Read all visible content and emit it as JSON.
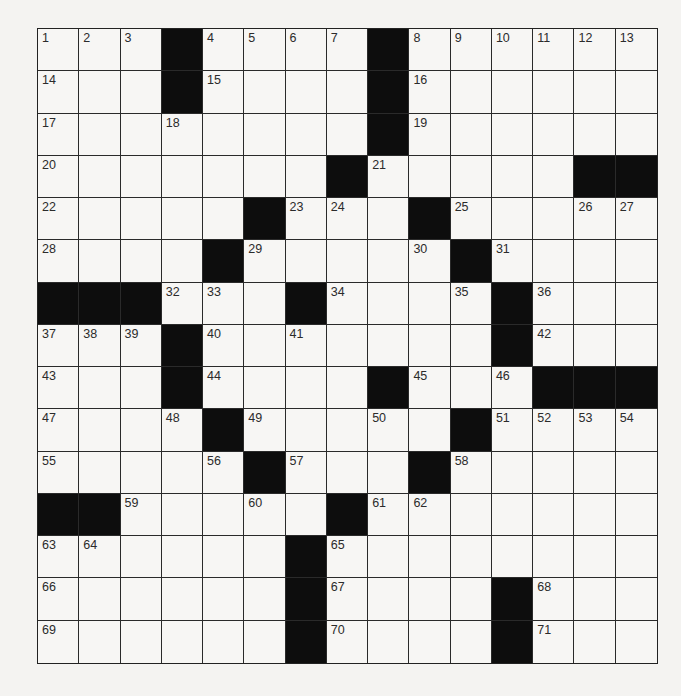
{
  "puzzle": {
    "rows": 15,
    "cols": 15,
    "layout": [
      "...#....#......",
      "...#....#......",
      "........#......",
      ".......#.....##",
      ".....#...#.....",
      "....#.....#....",
      "###...#....#...",
      "...#.......#...",
      "...#....#...###",
      "....#.....#....",
      ".....#...#.....",
      "##.....#.......",
      "......#........",
      "......#....#...",
      "......#....#..."
    ],
    "numbers": [
      [
        1,
        2,
        3,
        null,
        4,
        5,
        6,
        7,
        null,
        8,
        9,
        10,
        11,
        12,
        13
      ],
      [
        14,
        null,
        null,
        null,
        15,
        null,
        null,
        null,
        null,
        16,
        null,
        null,
        null,
        null,
        null
      ],
      [
        17,
        null,
        null,
        18,
        null,
        null,
        null,
        null,
        null,
        19,
        null,
        null,
        null,
        null,
        null
      ],
      [
        20,
        null,
        null,
        null,
        null,
        null,
        null,
        null,
        21,
        null,
        null,
        null,
        null,
        null,
        null
      ],
      [
        22,
        null,
        null,
        null,
        null,
        null,
        23,
        24,
        null,
        null,
        25,
        null,
        null,
        26,
        27
      ],
      [
        28,
        null,
        null,
        null,
        null,
        29,
        null,
        null,
        null,
        30,
        null,
        31,
        null,
        null,
        null
      ],
      [
        null,
        null,
        null,
        32,
        33,
        null,
        null,
        34,
        null,
        null,
        35,
        null,
        36,
        null,
        null
      ],
      [
        37,
        38,
        39,
        null,
        40,
        null,
        41,
        null,
        null,
        null,
        null,
        null,
        42,
        null,
        null
      ],
      [
        43,
        null,
        null,
        null,
        44,
        null,
        null,
        null,
        null,
        45,
        null,
        46,
        null,
        null,
        null
      ],
      [
        47,
        null,
        null,
        48,
        null,
        49,
        null,
        null,
        50,
        null,
        null,
        51,
        52,
        53,
        54
      ],
      [
        55,
        null,
        null,
        null,
        56,
        null,
        57,
        null,
        null,
        null,
        58,
        null,
        null,
        null,
        null
      ],
      [
        null,
        null,
        59,
        null,
        null,
        60,
        null,
        null,
        61,
        62,
        null,
        null,
        null,
        null,
        null
      ],
      [
        63,
        64,
        null,
        null,
        null,
        null,
        null,
        65,
        null,
        null,
        null,
        null,
        null,
        null,
        null
      ],
      [
        66,
        null,
        null,
        null,
        null,
        null,
        null,
        67,
        null,
        null,
        null,
        null,
        68,
        null,
        null
      ],
      [
        69,
        null,
        null,
        null,
        null,
        null,
        null,
        70,
        null,
        null,
        null,
        null,
        71,
        null,
        null
      ]
    ]
  }
}
